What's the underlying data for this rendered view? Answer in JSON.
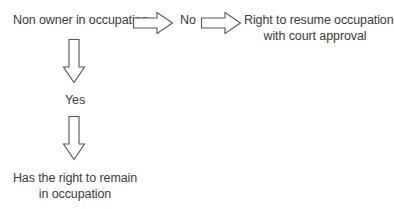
{
  "diagram": {
    "start_node": "Non owner in occupation",
    "branch_no_label": "No",
    "branch_yes_label": "Yes",
    "no_outcome": {
      "line1": "Right to resume occupation",
      "line2": "with court approval"
    },
    "yes_outcome": {
      "line1": "Has the right to remain",
      "line2": "in occupation"
    },
    "colors": {
      "text": "#3a3a3a",
      "arrow_stroke": "#555555",
      "arrow_fill": "#ffffff",
      "background": "#ffffff"
    }
  }
}
